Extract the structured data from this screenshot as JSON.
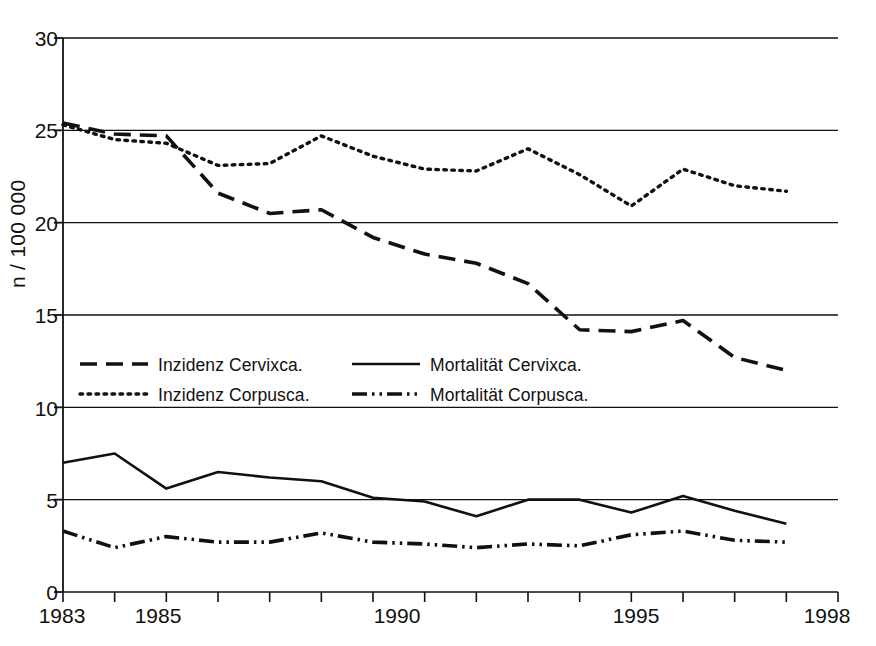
{
  "axes": {
    "ylabel": "n / 100 000",
    "ylim": [
      0,
      30
    ],
    "yticks": [
      "0",
      "5",
      "10",
      "15",
      "20",
      "25",
      "30"
    ],
    "xlim": [
      1983,
      1998
    ],
    "xtick_labels": [
      "1983",
      "1985",
      "1990",
      "1995",
      "1998"
    ],
    "xtick_values": [
      1983,
      1985,
      1990,
      1995,
      1998
    ],
    "grid": "horizontal",
    "line_color": "#111111"
  },
  "legend": {
    "position": "inside-left-middle",
    "entries": [
      {
        "label": "Inzidenz Cervixca.",
        "style": "dashed"
      },
      {
        "label": "Inzidenz Corpusca.",
        "style": "dotted"
      },
      {
        "label": "Mortalität Cervixca.",
        "style": "solid"
      },
      {
        "label": "Mortalität Corpusca.",
        "style": "dashdotdot"
      }
    ]
  },
  "chart_data": {
    "type": "line",
    "title": "",
    "xlabel": "",
    "ylabel": "n / 100 000",
    "xlim": [
      1983,
      1998
    ],
    "ylim": [
      0,
      30
    ],
    "grid": true,
    "legend_position": "inside left middle",
    "x": [
      1983,
      1984,
      1985,
      1986,
      1987,
      1988,
      1989,
      1990,
      1991,
      1992,
      1993,
      1994,
      1995,
      1996,
      1997
    ],
    "series": [
      {
        "name": "Inzidenz Cervixca.",
        "style": "dashed",
        "color": "#111111",
        "values": [
          25.4,
          24.8,
          24.7,
          21.6,
          20.5,
          20.7,
          19.2,
          18.3,
          17.8,
          16.7,
          14.2,
          14.1,
          14.7,
          12.7,
          12.0
        ]
      },
      {
        "name": "Inzidenz Corpusca.",
        "style": "dotted",
        "color": "#111111",
        "values": [
          25.3,
          24.5,
          24.3,
          23.1,
          23.2,
          24.7,
          23.6,
          22.9,
          22.8,
          24.0,
          22.6,
          20.9,
          22.9,
          22.0,
          21.7
        ]
      },
      {
        "name": "Mortalität Cervixca.",
        "style": "solid",
        "color": "#111111",
        "values": [
          7.0,
          7.5,
          5.6,
          6.5,
          6.2,
          6.0,
          5.1,
          4.9,
          4.1,
          5.0,
          5.0,
          4.3,
          5.2,
          4.4,
          3.7
        ]
      },
      {
        "name": "Mortalität Corpusca.",
        "style": "dashdotdot",
        "color": "#111111",
        "values": [
          3.3,
          2.4,
          3.0,
          2.7,
          2.7,
          3.2,
          2.7,
          2.6,
          2.4,
          2.6,
          2.5,
          3.1,
          3.3,
          2.8,
          2.7
        ]
      }
    ]
  }
}
